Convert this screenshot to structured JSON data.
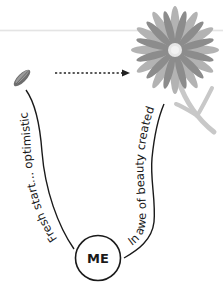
{
  "diagram": {
    "center_node": {
      "label": "ME"
    },
    "start": {
      "icon": "seed-icon",
      "path_label": "Fresh start... optimistic"
    },
    "end": {
      "icon": "flower-icon",
      "path_label": "In awe of beauty created"
    },
    "arrow": {
      "style": "dotted",
      "direction": "seed-to-flower"
    },
    "colors": {
      "line": "#1a1a1a",
      "petal_dark": "#8c8c8c",
      "petal_light": "#b0b0b0",
      "flower_center": "#e6e6e6",
      "stem": "#c4c4c4",
      "seed": "#6e6e6e"
    }
  }
}
